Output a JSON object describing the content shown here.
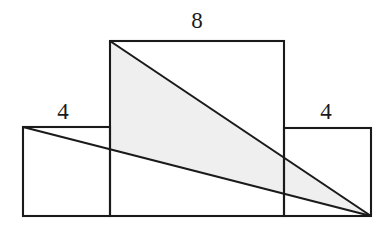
{
  "figure": {
    "canvas": {
      "width": 388,
      "height": 232
    },
    "colors": {
      "stroke": "#1a1a1a",
      "fill": "#ffffff",
      "shade": "#efefef",
      "label": "#1a1a1a",
      "background": "#ffffff"
    },
    "stroke_width": 2.1,
    "rectangles": [
      {
        "name": "left-rectangle",
        "label": "4",
        "x": 23,
        "y": 127,
        "width": 87,
        "height": 89,
        "label_x": 63,
        "label_y": 119
      },
      {
        "name": "middle-rectangle",
        "label": "8",
        "x": 110,
        "y": 41,
        "width": 174,
        "height": 175,
        "label_x": 197,
        "label_y": 28
      },
      {
        "name": "right-rectangle",
        "label": "4",
        "x": 284,
        "y": 128,
        "width": 87,
        "height": 88,
        "label_x": 326,
        "label_y": 119
      }
    ],
    "diagonals": [
      {
        "name": "upper-diagonal",
        "x1": 110,
        "y1": 41,
        "x2": 371,
        "y2": 216
      },
      {
        "name": "lower-diagonal",
        "x1": 23,
        "y1": 127,
        "x2": 371,
        "y2": 216
      }
    ],
    "shaded_region": {
      "name": "shaded-triangle",
      "points": "110,41 371,216 110,149",
      "description": "Region between the two diagonals bounded on the left by the middle rectangle's left edge"
    }
  }
}
